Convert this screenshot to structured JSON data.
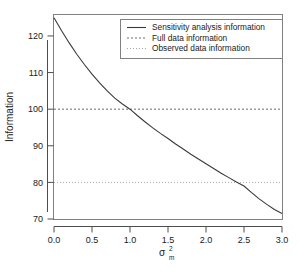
{
  "chart_data": {
    "type": "line",
    "title": "",
    "xlabel": "sigma_m^2",
    "xlabel_parts": {
      "base": "σ",
      "sup": "2",
      "sub": "m"
    },
    "ylabel": "Information",
    "xlim": [
      0.0,
      3.0
    ],
    "ylim": [
      70,
      126
    ],
    "xticks": [
      "0.0",
      "0.5",
      "1.0",
      "1.5",
      "2.0",
      "2.5",
      "3.0"
    ],
    "xtick_values": [
      0.0,
      0.5,
      1.0,
      1.5,
      2.0,
      2.5,
      3.0
    ],
    "yticks": [
      "70",
      "80",
      "90",
      "100",
      "110",
      "120"
    ],
    "ytick_values": [
      70,
      80,
      90,
      100,
      110,
      120
    ],
    "grid": false,
    "legend_position": "top-right",
    "series": [
      {
        "name": "Sensitivity analysis information",
        "style": "solid",
        "color": "#3a3a3a",
        "x": [
          0.0,
          0.1,
          0.2,
          0.3,
          0.4,
          0.5,
          0.6,
          0.7,
          0.8,
          0.9,
          1.0,
          1.1,
          1.2,
          1.3,
          1.4,
          1.5,
          1.6,
          1.7,
          1.8,
          1.9,
          2.0,
          2.1,
          2.2,
          2.3,
          2.4,
          2.5,
          2.6,
          2.7,
          2.8,
          2.9,
          3.0
        ],
        "values": [
          125.0,
          121.4,
          118.1,
          115.0,
          112.2,
          109.6,
          107.2,
          105.0,
          103.0,
          101.4,
          100.0,
          98.2,
          96.5,
          94.9,
          93.4,
          92.0,
          90.5,
          89.1,
          87.7,
          86.4,
          85.1,
          83.8,
          82.5,
          81.3,
          80.1,
          79.0,
          77.2,
          75.5,
          74.0,
          72.6,
          71.5
        ]
      },
      {
        "name": "Full data information",
        "style": "dashed",
        "color": "#6b6b6b",
        "constant": 100
      },
      {
        "name": "Observed data information",
        "style": "dotted",
        "color": "#a8a8a8",
        "constant": 80
      }
    ],
    "annotations": [
      {
        "text": "curve crosses full data information (100) at sigma_m^2 = 1.0"
      },
      {
        "text": "curve crosses observed data information (80) at sigma_m^2 = 2.4"
      }
    ]
  },
  "legend": {
    "entries": [
      {
        "label": "Sensitivity analysis information",
        "style": "solid"
      },
      {
        "label": "Full data information",
        "style": "dashed"
      },
      {
        "label": "Observed data information",
        "style": "dotted"
      }
    ]
  },
  "colors": {
    "background": "#ffffff",
    "frame": "#808080",
    "axis": "#4d4d4d",
    "curve": "#3a3a3a",
    "full_data_line": "#6b6b6b",
    "observed_data_line": "#a8a8a8",
    "text": "#1a1a1a"
  }
}
